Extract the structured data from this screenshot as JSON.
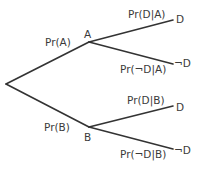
{
  "diagram": {
    "type": "probability-tree",
    "colors": {
      "line": "#333333",
      "text": "#3a3a3a",
      "background": "#ffffff"
    },
    "nodes": {
      "root": {
        "label": ""
      },
      "A": {
        "label": "A"
      },
      "B": {
        "label": "B"
      },
      "A_D": {
        "label": "D"
      },
      "A_notD": {
        "label": "¬D"
      },
      "B_D": {
        "label": "D"
      },
      "B_notD": {
        "label": "¬D"
      }
    },
    "edges": {
      "root_A": {
        "label": "Pr(A)"
      },
      "root_B": {
        "label": "Pr(B)"
      },
      "A_D": {
        "label": "Pr(D|A)"
      },
      "A_notD": {
        "label": "Pr(¬D|A)"
      },
      "B_D": {
        "label": "Pr(D|B)"
      },
      "B_notD": {
        "label": "Pr(¬D|B)"
      }
    }
  }
}
